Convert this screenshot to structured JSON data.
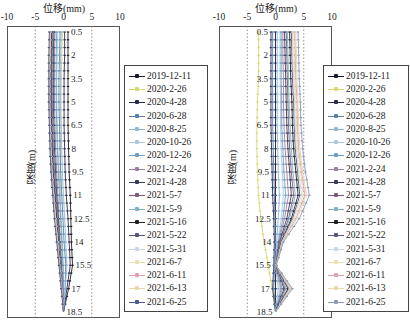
{
  "chart_data": [
    {
      "type": "line",
      "title": "",
      "xlabel": "位移(mm)",
      "ylabel": "深度(m)",
      "xlim": [
        -10,
        10
      ],
      "xticks": [
        "-10",
        "-5",
        "0",
        "5",
        "10"
      ],
      "ylim": [
        0,
        19
      ],
      "yticks": [
        "0.5",
        "2",
        "3.5",
        "5",
        "6.5",
        "8",
        "9.5",
        "11",
        "12.5",
        "14",
        "15.5",
        "17",
        "18.5"
      ],
      "reference_lines_x": [
        -5,
        5
      ],
      "grid": false,
      "legend_position": "right",
      "depths": [
        0.5,
        2,
        3.5,
        5,
        6.5,
        8,
        9.5,
        11,
        12.5,
        14,
        15.5,
        17,
        18.5
      ],
      "series": [
        {
          "name": "2019-12-11",
          "color": "#1a1a2e",
          "values": [
            0.8,
            0.8,
            0.8,
            0.8,
            0.8,
            0.9,
            1.0,
            1.2,
            1.3,
            1.4,
            1.6,
            0.9,
            0.0
          ]
        },
        {
          "name": "2020-2-26",
          "color": "#d8d870",
          "values": [
            -0.2,
            -0.3,
            -0.4,
            -0.5,
            -0.6,
            -0.6,
            -0.6,
            -0.5,
            -0.5,
            -0.4,
            -0.3,
            -0.2,
            0.0
          ]
        },
        {
          "name": "2020-4-28",
          "color": "#2b2b50",
          "values": [
            0.2,
            0.2,
            0.1,
            0.1,
            0.1,
            0.2,
            0.3,
            0.5,
            0.8,
            1.0,
            1.2,
            0.6,
            0.0
          ]
        },
        {
          "name": "2020-6-28",
          "color": "#5a7fa8",
          "values": [
            -0.6,
            -0.7,
            -0.8,
            -0.8,
            -0.7,
            -0.6,
            -0.5,
            -0.3,
            -0.1,
            0.1,
            0.4,
            0.3,
            0.0
          ]
        },
        {
          "name": "2020-8-25",
          "color": "#8fb8d8",
          "values": [
            -0.4,
            -0.5,
            -0.5,
            -0.5,
            -0.4,
            -0.3,
            -0.2,
            0.0,
            0.2,
            0.4,
            0.6,
            0.3,
            0.0
          ]
        },
        {
          "name": "2020-10-26",
          "color": "#a9c9e0",
          "values": [
            -1.0,
            -1.1,
            -1.2,
            -1.2,
            -1.1,
            -1.0,
            -0.8,
            -0.6,
            -0.4,
            -0.2,
            0.0,
            0.1,
            0.0
          ]
        },
        {
          "name": "2020-12-26",
          "color": "#6aa0c8",
          "values": [
            -1.2,
            -1.3,
            -1.3,
            -1.3,
            -1.2,
            -1.1,
            -0.9,
            -0.7,
            -0.5,
            -0.3,
            -0.1,
            0.0,
            0.0
          ]
        },
        {
          "name": "2021-2-24",
          "color": "#9a7fa0",
          "values": [
            -1.5,
            -1.6,
            -1.6,
            -1.6,
            -1.5,
            -1.4,
            -1.2,
            -1.0,
            -0.8,
            -0.6,
            -0.3,
            -0.1,
            0.0
          ]
        },
        {
          "name": "2021-4-28",
          "color": "#3a3a5a",
          "values": [
            -1.7,
            -1.8,
            -1.8,
            -1.8,
            -1.7,
            -1.6,
            -1.4,
            -1.2,
            -0.9,
            -0.7,
            -0.4,
            -0.2,
            0.0
          ]
        },
        {
          "name": "2021-5-7",
          "color": "#7a5a7a",
          "values": [
            -1.9,
            -2.0,
            -2.0,
            -2.0,
            -1.9,
            -1.8,
            -1.6,
            -1.3,
            -1.0,
            -0.8,
            -0.5,
            -0.2,
            0.0
          ]
        },
        {
          "name": "2021-5-9",
          "color": "#7fb0c8",
          "values": [
            -2.0,
            -2.1,
            -2.1,
            -2.1,
            -2.0,
            -1.9,
            -1.7,
            -1.4,
            -1.1,
            -0.8,
            -0.5,
            -0.2,
            0.0
          ]
        },
        {
          "name": "2021-5-16",
          "color": "#222222",
          "values": [
            -2.1,
            -2.2,
            -2.2,
            -2.2,
            -2.1,
            -2.0,
            -1.8,
            -1.5,
            -1.2,
            -0.9,
            -0.6,
            -0.3,
            0.0
          ]
        },
        {
          "name": "2021-5-22",
          "color": "#555577",
          "values": [
            -2.2,
            -2.3,
            -2.3,
            -2.3,
            -2.2,
            -2.1,
            -1.9,
            -1.6,
            -1.3,
            -1.0,
            -0.6,
            -0.3,
            0.0
          ]
        },
        {
          "name": "2021-5-31",
          "color": "#c8d8e8",
          "values": [
            -2.3,
            -2.4,
            -2.4,
            -2.4,
            -2.3,
            -2.2,
            -2.0,
            -1.7,
            -1.4,
            -1.0,
            -0.7,
            -0.3,
            0.0
          ]
        },
        {
          "name": "2021-6-7",
          "color": "#e8e0b0",
          "values": [
            -2.3,
            -2.4,
            -2.5,
            -2.5,
            -2.4,
            -2.3,
            -2.1,
            -1.8,
            -1.4,
            -1.1,
            -0.7,
            -0.3,
            0.0
          ]
        },
        {
          "name": "2021-6-11",
          "color": "#e0a0b0",
          "values": [
            -2.4,
            -2.5,
            -2.5,
            -2.5,
            -2.4,
            -2.3,
            -2.1,
            -1.8,
            -1.5,
            -1.1,
            -0.7,
            -0.3,
            0.0
          ]
        },
        {
          "name": "2021-6-13",
          "color": "#e8d8a8",
          "values": [
            -2.4,
            -2.5,
            -2.6,
            -2.6,
            -2.5,
            -2.4,
            -2.2,
            -1.9,
            -1.5,
            -1.1,
            -0.8,
            -0.4,
            0.0
          ]
        },
        {
          "name": "2021-6-25",
          "color": "#4a5a90",
          "values": [
            -2.5,
            -2.6,
            -2.6,
            -2.6,
            -2.5,
            -2.4,
            -2.2,
            -1.9,
            -1.6,
            -1.2,
            -0.8,
            -0.4,
            0.0
          ]
        }
      ]
    },
    {
      "type": "line",
      "title": "",
      "xlabel": "位移(mm)",
      "ylabel": "深度(m)",
      "xlim": [
        -10,
        10
      ],
      "xticks": [
        "-10",
        "-5",
        "0",
        "5",
        "10"
      ],
      "ylim": [
        0,
        19
      ],
      "yticks": [
        "0.5",
        "2",
        "3.5",
        "5",
        "6.5",
        "8",
        "9.5",
        "11",
        "12.5",
        "14",
        "15.5",
        "17",
        "18.5"
      ],
      "reference_lines_x": [
        -5,
        5
      ],
      "grid": false,
      "legend_position": "right",
      "depths": [
        0.5,
        2,
        3.5,
        5,
        6.5,
        8,
        9.5,
        11,
        12.5,
        14,
        15.5,
        17,
        18.5
      ],
      "series": [
        {
          "name": "2019-12-11",
          "color": "#1a1a2e",
          "values": [
            0.0,
            0.0,
            0.0,
            0.0,
            0.0,
            0.0,
            0.0,
            0.0,
            0.0,
            0.0,
            0.0,
            0.0,
            0.0
          ]
        },
        {
          "name": "2020-2-26",
          "color": "#d8d870",
          "values": [
            -3.0,
            -3.0,
            -3.0,
            -3.2,
            -3.3,
            -3.3,
            -3.2,
            -3.0,
            -2.6,
            -2.0,
            -1.3,
            -0.6,
            0.0
          ]
        },
        {
          "name": "2020-4-28",
          "color": "#2b2b50",
          "values": [
            -0.8,
            -0.8,
            -0.8,
            -0.8,
            -0.8,
            -0.7,
            -0.6,
            -0.5,
            -0.3,
            -0.2,
            -0.3,
            -0.5,
            0.0
          ]
        },
        {
          "name": "2020-6-28",
          "color": "#5a7fa8",
          "values": [
            -0.5,
            -0.5,
            -0.5,
            -0.5,
            -0.5,
            -0.4,
            -0.3,
            -0.2,
            -0.1,
            0.0,
            -0.2,
            -0.3,
            0.0
          ]
        },
        {
          "name": "2020-8-25",
          "color": "#8fb8d8",
          "values": [
            0.3,
            0.3,
            0.3,
            0.3,
            0.3,
            0.4,
            0.5,
            0.7,
            0.5,
            0.2,
            0.0,
            0.5,
            0.0
          ]
        },
        {
          "name": "2020-10-26",
          "color": "#a9c9e0",
          "values": [
            0.8,
            0.8,
            0.8,
            0.9,
            0.9,
            1.0,
            1.2,
            1.4,
            1.0,
            0.4,
            0.0,
            0.8,
            0.0
          ]
        },
        {
          "name": "2020-12-26",
          "color": "#6aa0c8",
          "values": [
            1.0,
            1.0,
            1.0,
            1.1,
            1.1,
            1.3,
            1.5,
            1.8,
            1.3,
            0.5,
            0.0,
            1.0,
            0.0
          ]
        },
        {
          "name": "2021-2-24",
          "color": "#9a7fa0",
          "values": [
            1.3,
            1.3,
            1.4,
            1.4,
            1.5,
            1.7,
            2.0,
            2.3,
            1.6,
            0.6,
            0.0,
            1.2,
            0.0
          ]
        },
        {
          "name": "2021-4-28",
          "color": "#3a3a5a",
          "values": [
            1.6,
            1.7,
            1.8,
            1.9,
            2.0,
            2.2,
            2.5,
            2.8,
            2.0,
            0.7,
            0.1,
            1.5,
            0.0
          ]
        },
        {
          "name": "2021-5-7",
          "color": "#7a5a7a",
          "values": [
            1.9,
            2.0,
            2.1,
            2.2,
            2.3,
            2.5,
            2.8,
            3.2,
            2.3,
            0.8,
            0.1,
            1.7,
            0.0
          ]
        },
        {
          "name": "2021-5-9",
          "color": "#7fb0c8",
          "values": [
            2.1,
            2.2,
            2.3,
            2.4,
            2.6,
            2.8,
            3.1,
            3.5,
            2.5,
            0.9,
            0.1,
            1.9,
            0.0
          ]
        },
        {
          "name": "2021-5-16",
          "color": "#222222",
          "values": [
            2.5,
            2.6,
            2.7,
            2.9,
            3.0,
            3.2,
            3.6,
            4.0,
            2.8,
            1.0,
            0.1,
            2.2,
            0.0
          ]
        },
        {
          "name": "2021-5-22",
          "color": "#555577",
          "values": [
            2.8,
            2.9,
            3.0,
            3.2,
            3.3,
            3.5,
            3.9,
            4.3,
            3.0,
            1.1,
            0.1,
            2.4,
            0.0
          ]
        },
        {
          "name": "2021-5-31",
          "color": "#c8d8e8",
          "values": [
            3.0,
            3.1,
            3.2,
            3.4,
            3.5,
            3.7,
            4.1,
            4.6,
            3.2,
            1.1,
            0.1,
            2.5,
            0.0
          ]
        },
        {
          "name": "2021-6-7",
          "color": "#e8e0b0",
          "values": [
            3.2,
            3.3,
            3.4,
            3.6,
            3.7,
            3.9,
            4.4,
            4.9,
            3.4,
            1.2,
            0.1,
            2.6,
            0.0
          ]
        },
        {
          "name": "2021-6-11",
          "color": "#e0a0b0",
          "values": [
            3.4,
            3.5,
            3.6,
            3.8,
            3.9,
            4.1,
            4.6,
            5.2,
            3.6,
            1.2,
            0.1,
            2.7,
            0.0
          ]
        },
        {
          "name": "2021-6-13",
          "color": "#e8d8a8",
          "values": [
            3.6,
            3.7,
            3.8,
            4.0,
            4.1,
            4.3,
            4.8,
            5.5,
            3.8,
            1.3,
            0.1,
            2.8,
            0.0
          ]
        },
        {
          "name": "2021-6-25",
          "color": "#8a9ac0",
          "values": [
            4.0,
            4.1,
            4.2,
            4.4,
            4.5,
            4.8,
            5.3,
            6.0,
            4.2,
            1.4,
            0.1,
            3.0,
            0.0
          ]
        }
      ]
    }
  ],
  "panels": [
    {
      "xlabel": "位移(mm)",
      "ylabel": "深度(m)"
    },
    {
      "xlabel": "位移(mm)",
      "ylabel": "深度(m)"
    }
  ]
}
